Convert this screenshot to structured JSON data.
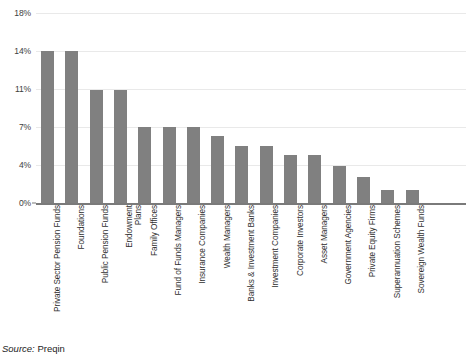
{
  "chart_data": {
    "type": "bar",
    "title": "",
    "subtitle": "",
    "xlabel": "",
    "ylabel": "",
    "ylim": [
      0,
      18
    ],
    "grid": true,
    "legend": false,
    "orientation": "vertical",
    "bar_color": "#808080",
    "gridline_color": "#e9e9e9",
    "axis_color": "#7a7a7a",
    "ytick_labels": [
      "0%",
      "4%",
      "7%",
      "11%",
      "14%",
      "18%"
    ],
    "ytick_values": [
      0,
      3.5,
      7,
      10.5,
      14,
      17.5
    ],
    "categories": [
      "Private Sector Pension Funds",
      "Foundations",
      "Public Pension Funds",
      "Endowment Plans",
      "Family Offices",
      "Fund of Funds Managers",
      "Insurance Companies",
      "Wealth Managers",
      "Banks & Investment Banks",
      "Investment Companies",
      "Corporate Investors",
      "Asset Managers",
      "Government Agencies",
      "Private Equity Firms",
      "Superannuation Schemes",
      "Sovereign Wealth Funds"
    ],
    "values": [
      14.0,
      14.0,
      10.4,
      10.4,
      7.0,
      7.0,
      7.0,
      6.2,
      5.3,
      5.3,
      4.4,
      4.4,
      3.4,
      2.4,
      1.2,
      1.2
    ]
  },
  "categories_display": [
    "Private Sector Pension Funds",
    "Foundations",
    "Public Pension Funds",
    "Endowment\nPlans",
    "Family Offices",
    "Fund of Funds Managers",
    "Insurance Companies",
    "Wealth Managers",
    "Banks & Investment Banks",
    "Investment Companies",
    "Corporate Investors",
    "Asset Managers",
    "Government Agencies",
    "Private Equity Firms",
    "Superannuation Schemes",
    "Sovereign Wealth Funds"
  ],
  "source": {
    "prefix": "Source:",
    "value": "Preqin"
  }
}
